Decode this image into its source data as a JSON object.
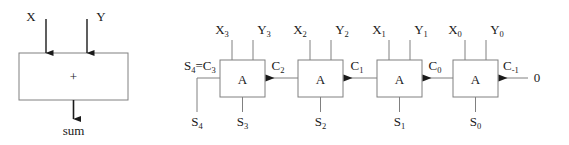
{
  "figure": {
    "title": "",
    "left_diagram": {
      "name": "abstract-adder",
      "box_label": "+",
      "inputs": [
        {
          "name": "X",
          "label": "X"
        },
        {
          "name": "Y",
          "label": "Y"
        }
      ],
      "output": {
        "name": "sum",
        "label": "sum"
      }
    },
    "right_diagram": {
      "name": "ripple-carry-adder",
      "cells": [
        {
          "name": "adder-cell-3",
          "box_label": "A",
          "x_input": "X",
          "x_sub": "3",
          "y_input": "Y",
          "y_sub": "3",
          "sum_out": "S",
          "sum_sub": "3",
          "carry_in": "C",
          "carry_in_sub": "2"
        },
        {
          "name": "adder-cell-2",
          "box_label": "A",
          "x_input": "X",
          "x_sub": "2",
          "y_input": "Y",
          "y_sub": "2",
          "sum_out": "S",
          "sum_sub": "2",
          "carry_in": "C",
          "carry_in_sub": "1"
        },
        {
          "name": "adder-cell-1",
          "box_label": "A",
          "x_input": "X",
          "x_sub": "1",
          "y_input": "Y",
          "y_sub": "1",
          "sum_out": "S",
          "sum_sub": "1",
          "carry_in": "C",
          "carry_in_sub": "0"
        },
        {
          "name": "adder-cell-0",
          "box_label": "A",
          "x_input": "X",
          "x_sub": "0",
          "y_input": "Y",
          "y_sub": "0",
          "sum_out": "S",
          "sum_sub": "0",
          "carry_in": "C",
          "carry_in_sub": "-1"
        }
      ],
      "carry_out_label": {
        "prefix": "S",
        "prefix_sub": "4",
        "eq": "=",
        "suffix": "C",
        "suffix_sub": "3"
      },
      "msb_sum_label": {
        "base": "S",
        "sub": "4"
      },
      "carry_in_constant": "0"
    },
    "colors": {
      "stroke": "#808080",
      "arrow": "#1a1a1a",
      "text": "#1a1a1a",
      "background": "#ffffff"
    }
  }
}
